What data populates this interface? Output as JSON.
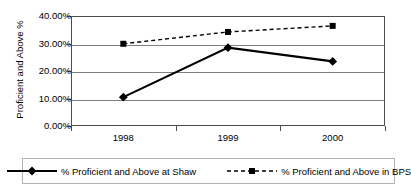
{
  "chart_data": {
    "type": "line",
    "title": "",
    "subtitle": "",
    "xlabel": "",
    "ylabel": "Proficient and Above %",
    "categories": [
      "1998",
      "1999",
      "2000"
    ],
    "ylim": [
      0,
      40
    ],
    "ytick_values": [
      0,
      10,
      20,
      30,
      40
    ],
    "ytick_labels": [
      "0.00%",
      "10.00%",
      "20.00%",
      "30.00%",
      "40.00%"
    ],
    "grid": true,
    "legend_position": "bottom",
    "series": [
      {
        "name": "% Proficient and Above at Shaw",
        "marker": "diamond",
        "line_style": "solid",
        "color": "#000000",
        "values": [
          10.5,
          28.5,
          23.5
        ]
      },
      {
        "name": "% Proficient and Above in BPS",
        "marker": "square",
        "line_style": "dashed",
        "color": "#000000",
        "values": [
          29.9,
          34.2,
          36.4
        ]
      }
    ]
  },
  "legend": {
    "entries": [
      {
        "label": "% Proficient and Above at Shaw",
        "marker_icon": "diamond-marker-icon",
        "line_icon": "solid-line-icon"
      },
      {
        "label": "% Proficient and Above in BPS",
        "marker_icon": "square-marker-icon",
        "line_icon": "dashed-line-icon"
      }
    ]
  }
}
